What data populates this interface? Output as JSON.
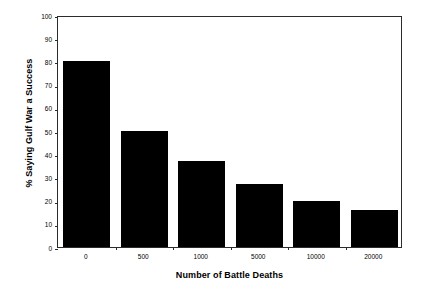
{
  "chart_data": {
    "type": "bar",
    "title": "",
    "xlabel": "Number of Battle Deaths",
    "ylabel": "% Saying Gulf War a Success",
    "categories": [
      "0",
      "500",
      "1000",
      "5000",
      "10000",
      "20000"
    ],
    "values": [
      80,
      50,
      37,
      27,
      20,
      16
    ],
    "series": [
      {
        "name": "% Saying Gulf War a Success",
        "values": [
          80,
          50,
          37,
          27,
          20,
          16
        ]
      }
    ],
    "ylim": [
      0,
      100
    ],
    "ytick_step": 10,
    "yticks": [
      0,
      10,
      20,
      30,
      40,
      50,
      60,
      70,
      80,
      90,
      100
    ],
    "ytick_labels": [
      "0",
      "10",
      "20",
      "30",
      "40",
      "50",
      "60",
      "70",
      "80",
      "90",
      "100"
    ],
    "grid": false,
    "legend": false,
    "legend_position": "none",
    "bar_color": "#000000",
    "axis_color": "#2b2b2b",
    "background_color": "#ffffff"
  }
}
